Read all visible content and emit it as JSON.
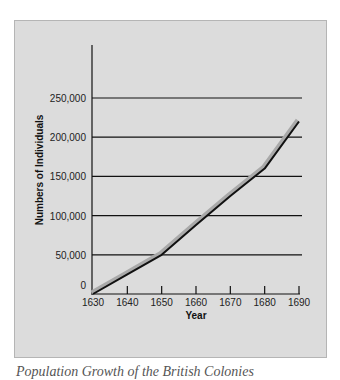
{
  "chart_data": {
    "type": "line",
    "title": "Population Growth of the British Colonies",
    "xlabel": "Year",
    "ylabel": "Numbers of Individuals",
    "x": [
      1630,
      1640,
      1650,
      1660,
      1670,
      1680,
      1690
    ],
    "series": [
      {
        "name": "Population",
        "values": [
          0,
          25000,
          50000,
          88000,
          125000,
          160000,
          220000
        ]
      }
    ],
    "xticks": [
      "1630",
      "1640",
      "1650",
      "1660",
      "1670",
      "1680",
      "1690"
    ],
    "yticks": [
      "0",
      "50,000",
      "100,000",
      "150,000",
      "200,000",
      "250,000"
    ],
    "ylim": [
      0,
      250000
    ],
    "xlim": [
      1630,
      1690
    ],
    "grid": true,
    "legend": null
  },
  "colors": {
    "panel": "#dcdcdc",
    "line_main": "#111111",
    "line_shadow": "#a9a9a9"
  }
}
